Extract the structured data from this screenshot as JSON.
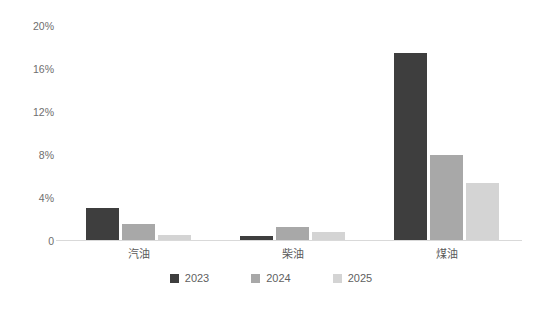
{
  "chart_data": {
    "type": "bar",
    "title": "",
    "subtitle": "",
    "xlabel": "",
    "ylabel": "",
    "categories": [
      "汽油",
      "柴油",
      "煤油"
    ],
    "series": [
      {
        "name": "2023",
        "color": "#3e3e3e",
        "values": [
          3.1,
          0.5,
          17.5
        ]
      },
      {
        "name": "2024",
        "color": "#a8a8a8",
        "values": [
          1.6,
          1.3,
          8.0
        ]
      },
      {
        "name": "2025",
        "color": "#d4d4d4",
        "values": [
          0.6,
          0.8,
          5.4
        ]
      }
    ],
    "ylim": [
      0,
      20
    ],
    "ytick_values": [
      20,
      16,
      12,
      8,
      4,
      0
    ],
    "ytick_labels": [
      "20%",
      "16%",
      "12%",
      "8%",
      "4%",
      "0"
    ],
    "grid": false,
    "legend_position": "bottom",
    "axis_line_color": "#d9d9d9",
    "background_color": "#ffffff",
    "text_color": "#5f5f5f"
  }
}
